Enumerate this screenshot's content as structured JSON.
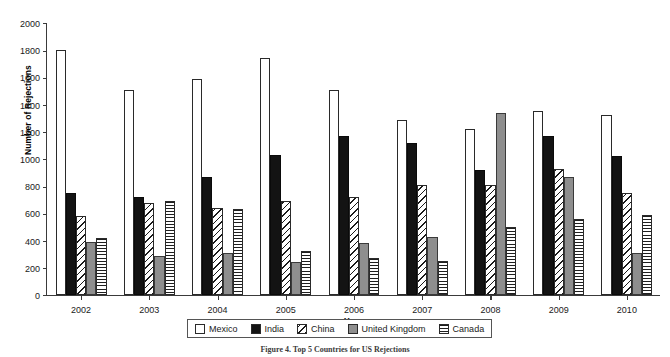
{
  "chart_data": {
    "type": "bar",
    "title": "",
    "xlabel": "Year",
    "ylabel": "Number of Rejections",
    "categories": [
      "2002",
      "2003",
      "2004",
      "2005",
      "2006",
      "2007",
      "2008",
      "2009",
      "2010"
    ],
    "ylim": [
      0,
      2000
    ],
    "ytick_step": 200,
    "yticks": [
      0,
      200,
      400,
      600,
      800,
      1000,
      1200,
      1400,
      1600,
      1800,
      2000
    ],
    "grid": false,
    "legend_position": "bottom-center",
    "series": [
      {
        "name": "Mexico",
        "fill": "white",
        "color": "#ffffff",
        "values": [
          1800,
          1510,
          1590,
          1740,
          1510,
          1290,
          1220,
          1350,
          1320
        ]
      },
      {
        "name": "India",
        "fill": "solid-black",
        "color": "#131313",
        "values": [
          750,
          720,
          870,
          1030,
          1170,
          1120,
          920,
          1170,
          1020
        ]
      },
      {
        "name": "China",
        "fill": "diagonal-hatch",
        "color": "#ffffff",
        "values": [
          580,
          680,
          640,
          690,
          720,
          810,
          810,
          930,
          750
        ]
      },
      {
        "name": "United Kingdom",
        "fill": "solid-gray",
        "color": "#8e8e8e",
        "values": [
          390,
          290,
          310,
          240,
          380,
          430,
          1340,
          870,
          310
        ]
      },
      {
        "name": "Canada",
        "fill": "horizontal-hatch",
        "color": "#ffffff",
        "values": [
          420,
          690,
          630,
          320,
          270,
          250,
          500,
          560,
          590
        ]
      }
    ]
  },
  "caption": "Figure 4. Top 5 Countries for US Rejections"
}
